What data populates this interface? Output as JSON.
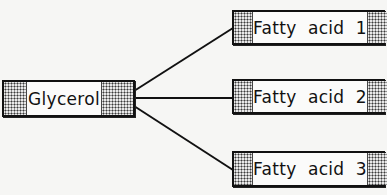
{
  "diagram": {
    "type": "triglyceride-structure",
    "center_node": {
      "id": "glycerol",
      "label": "Glycerol"
    },
    "nodes": [
      {
        "id": "fatty-acid-1",
        "label": "Fatty  acid  1"
      },
      {
        "id": "fatty-acid-2",
        "label": "Fatty  acid  2"
      },
      {
        "id": "fatty-acid-3",
        "label": "Fatty  acid  3"
      }
    ],
    "edges": [
      {
        "from": "glycerol",
        "to": "fatty-acid-1"
      },
      {
        "from": "glycerol",
        "to": "fatty-acid-2"
      },
      {
        "from": "glycerol",
        "to": "fatty-acid-3"
      }
    ],
    "colors": {
      "line": "#111111",
      "box_border": "#111111",
      "box_fill": "#fbfbfa",
      "hatch": "#3a3a3a",
      "background": "#f6f6f4"
    }
  }
}
